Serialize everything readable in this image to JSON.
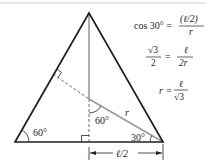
{
  "diagram": {
    "colors": {
      "triangle": "#231f20",
      "construction": "#9a9a9a",
      "dashed": "#6d6d6d",
      "top_rule": "#cfcfcf"
    },
    "angle_labels": {
      "bottom_left": "60°",
      "center": "60°",
      "bottom_right": "30°"
    },
    "segment_labels": {
      "radius": "r",
      "half_side": "ℓ/2"
    },
    "equations": {
      "eq1": {
        "lhs": "cos 30° =",
        "num": "(ℓ/2)",
        "den": "r"
      },
      "eq2": {
        "lhs_num": "√3",
        "lhs_den": "2",
        "eq": "=",
        "num": "ℓ",
        "den": "2r"
      },
      "eq3": {
        "lhs": "r =",
        "num": "ℓ",
        "den": "√3"
      }
    }
  }
}
